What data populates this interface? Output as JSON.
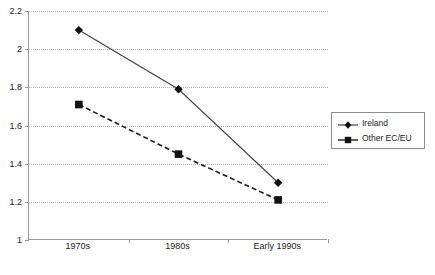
{
  "chart_data": {
    "type": "line",
    "title": "",
    "xlabel": "",
    "ylabel": "",
    "categories": [
      "1970s",
      "1980s",
      "Early 1990s"
    ],
    "series": [
      {
        "name": "Ireland",
        "marker": "diamond",
        "line_style": "solid",
        "color": "#3f3f3f",
        "values": [
          2.1,
          1.79,
          1.3
        ]
      },
      {
        "name": "Other EC/EU",
        "marker": "square",
        "line_style": "dashed",
        "color": "#1a1a1a",
        "values": [
          1.71,
          1.45,
          1.21
        ]
      }
    ],
    "ylim": [
      1.0,
      2.2
    ],
    "yticks": [
      "1",
      "1.2",
      "1.4",
      "1.6",
      "1.8",
      "2",
      "2.2"
    ],
    "ytick_values": [
      1.0,
      1.2,
      1.4,
      1.6,
      1.8,
      2.0,
      2.2
    ],
    "grid": true,
    "grid_axis": "y",
    "legend_position": "right"
  },
  "legend": {
    "entries": [
      {
        "label": "Ireland"
      },
      {
        "label": "Other EC/EU"
      }
    ]
  },
  "colors": {
    "axis": "#9a9a9a",
    "grid": "#b5b5b5",
    "series_ireland": "#3f3f3f",
    "series_other": "#1a1a1a",
    "legend_border": "#8c8c8c",
    "background": "#ffffff"
  }
}
